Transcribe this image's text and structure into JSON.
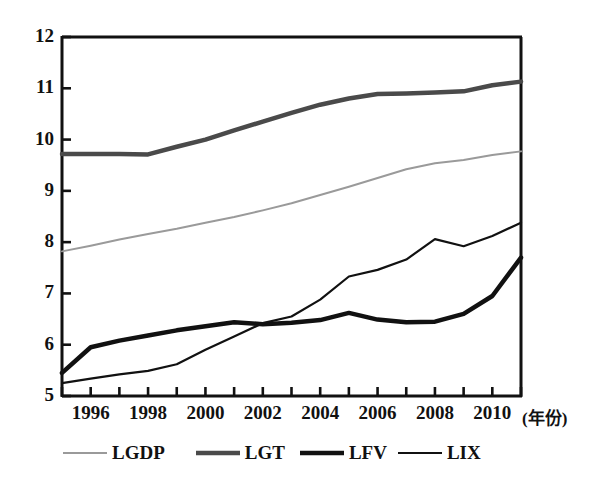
{
  "chart_data": {
    "type": "line",
    "title": "",
    "subtitle": "",
    "xlabel": "(年份)",
    "ylabel": "",
    "xlim": [
      1995,
      2011
    ],
    "ylim": [
      5,
      12
    ],
    "grid": false,
    "legend_position": "bottom",
    "x_tick_labels": [
      "1996",
      "1998",
      "2000",
      "2002",
      "2004",
      "2006",
      "2008",
      "2010"
    ],
    "x_tick_values": [
      1996,
      1998,
      2000,
      2002,
      2004,
      2006,
      2008,
      2010
    ],
    "y_tick_labels": [
      "5",
      "6",
      "7",
      "8",
      "9",
      "10",
      "11",
      "12"
    ],
    "y_tick_values": [
      5,
      6,
      7,
      8,
      9,
      10,
      11,
      12
    ],
    "x": [
      1995,
      1996,
      1997,
      1998,
      1999,
      2000,
      2001,
      2002,
      2003,
      2004,
      2005,
      2006,
      2007,
      2008,
      2009,
      2010,
      2011
    ],
    "series": [
      {
        "name": "LGDP",
        "color": "#9a9a9a",
        "width": 2.0,
        "values": [
          7.82,
          7.93,
          8.05,
          8.16,
          8.26,
          8.38,
          8.49,
          8.62,
          8.76,
          8.92,
          9.08,
          9.25,
          9.42,
          9.54,
          9.6,
          9.7,
          9.77
        ]
      },
      {
        "name": "LGT",
        "color": "#4a4a4a",
        "width": 4.5,
        "values": [
          9.72,
          9.72,
          9.72,
          9.71,
          9.86,
          10.0,
          10.18,
          10.35,
          10.52,
          10.68,
          10.8,
          10.89,
          10.9,
          10.92,
          10.94,
          11.06,
          11.13
        ]
      },
      {
        "name": "LFV",
        "color": "#111111",
        "width": 4.5,
        "values": [
          5.45,
          5.95,
          6.08,
          6.18,
          6.28,
          6.36,
          6.44,
          6.4,
          6.43,
          6.48,
          6.62,
          6.49,
          6.44,
          6.45,
          6.6,
          6.95,
          7.7
        ]
      },
      {
        "name": "LIX",
        "color": "#111111",
        "width": 2.2,
        "values": [
          5.25,
          5.34,
          5.42,
          5.49,
          5.62,
          5.9,
          6.16,
          6.42,
          6.55,
          6.88,
          7.33,
          7.46,
          7.66,
          8.06,
          7.92,
          8.12,
          8.38
        ]
      }
    ]
  },
  "legend": {
    "entries": [
      {
        "label": "LGDP",
        "swatch": "thin-gray-line"
      },
      {
        "label": "LGT",
        "swatch": "thick-gray-line"
      },
      {
        "label": "LFV",
        "swatch": "thick-black-line"
      },
      {
        "label": "LIX",
        "swatch": "thin-black-line"
      }
    ]
  },
  "axes": {
    "x_axis_title": "(年份)"
  }
}
